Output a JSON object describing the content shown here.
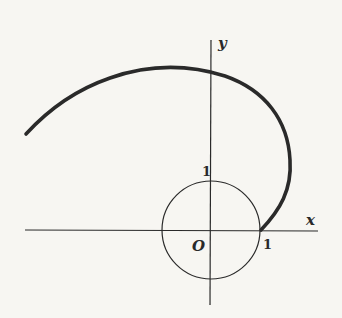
{
  "figure": {
    "type": "spiral-curve-with-unit-circle",
    "axes": {
      "x_label": "x",
      "y_label": "y",
      "origin_label": "O"
    },
    "ticks": {
      "x_tick_label": "1",
      "y_tick_label": "1"
    },
    "unit_circle": {
      "center": [
        0,
        0
      ],
      "radius": 1
    },
    "curve": {
      "description": "Thick spiral starting at (1,0) on the unit circle, sweeping counterclockwise up and to the left",
      "start_point": [
        1,
        0
      ]
    },
    "colors": {
      "background": "#f7f6f2",
      "ink": "#2a2a2a"
    }
  }
}
